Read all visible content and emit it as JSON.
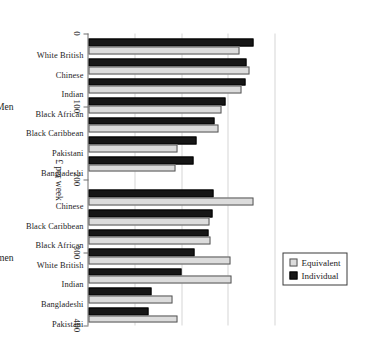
{
  "chart_data": {
    "type": "bar",
    "orientation": "rotated-90",
    "title": "",
    "xlabel": "",
    "ylabel": "£ per week",
    "ylim": [
      0,
      400
    ],
    "yticks": [
      0,
      100,
      200,
      300,
      400
    ],
    "ytick_labels": [
      "0",
      "100",
      "200",
      "300",
      "400"
    ],
    "grid": true,
    "grid_axis": "value",
    "legend": {
      "position": "top-right",
      "entries": [
        {
          "name": "Equivalent",
          "color": "#dcdcdc"
        },
        {
          "name": "Individual",
          "color": "#161616"
        }
      ]
    },
    "groups": [
      {
        "name": "Men",
        "categories": [
          "White British",
          "Chinese",
          "Indian",
          "Black African",
          "Black Caribbean",
          "Pakistani",
          "Bangladeshi"
        ],
        "series": [
          {
            "name": "Individual",
            "values": [
              355,
              340,
              338,
              295,
              272,
              232,
              226
            ]
          },
          {
            "name": "Equivalent",
            "values": [
              325,
              346,
              330,
              287,
              280,
              192,
              188
            ]
          }
        ]
      },
      {
        "name": "Women",
        "categories": [
          "Chinese",
          "Black Caribbean",
          "Black African",
          "White British",
          "Indian",
          "Bangladeshi",
          "Pakistani"
        ],
        "series": [
          {
            "name": "Individual",
            "values": [
              268,
              266,
              258,
              228,
              199,
              136,
              128
            ]
          },
          {
            "name": "Equivalent",
            "values": [
              355,
              260,
              262,
              305,
              307,
              180,
              192
            ]
          }
        ]
      }
    ]
  },
  "axis": {
    "value_axis_title": "£ per week"
  },
  "legend": {
    "equivalent_label": "Equivalent",
    "individual_label": "Individual"
  },
  "group_labels": {
    "men": "Men",
    "women": "Women"
  },
  "colors": {
    "equivalent": "#dcdcdc",
    "individual": "#161616",
    "axis": "#6f6f6f",
    "grid": "#d6d6d6"
  },
  "caption_artifact": ""
}
